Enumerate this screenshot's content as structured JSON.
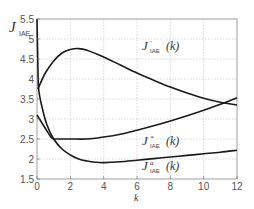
{
  "chart_data": {
    "type": "line",
    "title": "",
    "xlabel": "k",
    "ylabel": "J_IAE",
    "xlim": [
      0,
      12
    ],
    "ylim": [
      1.5,
      5.5
    ],
    "grid": true,
    "x_ticks": [
      "0",
      "2",
      "4",
      "6",
      "8",
      "10",
      "12"
    ],
    "y_ticks": [
      "1.5",
      "2",
      "2.5",
      "3",
      "3.5",
      "4",
      "4.5",
      "5",
      "5.5"
    ],
    "legend": "inline annotations",
    "series": [
      {
        "name": "J'_IAE(k)",
        "label_main": "J",
        "label_sup": "'",
        "label_sub": "IAE",
        "label_arg": "(k)",
        "x": [
          0.05,
          0.5,
          1,
          1.5,
          2,
          2.5,
          3,
          4,
          5,
          6,
          7,
          8,
          9,
          10,
          11,
          12
        ],
        "y": [
          3.75,
          4.15,
          4.45,
          4.65,
          4.74,
          4.76,
          4.72,
          4.55,
          4.35,
          4.15,
          3.97,
          3.8,
          3.65,
          3.52,
          3.42,
          3.35
        ]
      },
      {
        "name": "J*_IAE(k)",
        "label_main": "J",
        "label_sup": "*",
        "label_sub": "IAE",
        "label_arg": "(k)",
        "x": [
          0,
          0.3,
          0.6,
          0.9,
          1.2,
          2,
          3,
          4,
          5,
          6,
          7,
          8,
          9,
          10,
          11,
          12
        ],
        "y": [
          3.1,
          2.9,
          2.7,
          2.52,
          2.5,
          2.5,
          2.5,
          2.55,
          2.62,
          2.72,
          2.83,
          2.95,
          3.08,
          3.22,
          3.37,
          3.53
        ]
      },
      {
        "name": "J^a_IAE(k)",
        "label_main": "J",
        "label_sup": "a",
        "label_sub": "IAE",
        "label_arg": "(k)",
        "x": [
          0,
          0.05,
          0.1,
          0.3,
          0.6,
          1,
          1.5,
          2,
          2.5,
          3,
          3.5,
          4,
          5,
          6,
          7,
          8,
          9,
          10,
          11,
          12
        ],
        "y": [
          5.5,
          4.4,
          3.75,
          3.3,
          2.85,
          2.5,
          2.25,
          2.1,
          2.0,
          1.95,
          1.92,
          1.91,
          1.93,
          1.97,
          2.01,
          2.05,
          2.09,
          2.13,
          2.17,
          2.22
        ]
      }
    ],
    "annotations": [
      {
        "series": 0,
        "x": 6.3,
        "y": 4.72
      },
      {
        "series": 1,
        "x": 6.3,
        "y": 2.35
      },
      {
        "series": 2,
        "x": 6.3,
        "y": 1.73
      }
    ]
  },
  "axis": {
    "x_label": "k",
    "y_label_main": "J",
    "y_label_sub": "IAE"
  }
}
